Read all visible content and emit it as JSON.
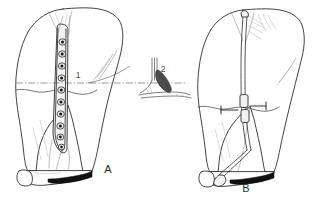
{
  "figure": {
    "background_color": "#ffffff",
    "ink_color": "#1f1f1f",
    "width": 319,
    "height": 203
  },
  "panels": [
    {
      "id": "A",
      "caption": "A",
      "caption_x": 108,
      "caption_y": 170,
      "description": "Leg with plate osteosynthesis, plate fixed with screws along the bone shaft",
      "implant": "bone-plate-with-screws",
      "screw_count": 10,
      "fracture_level_y": 89
    },
    {
      "id": "B",
      "caption": "B",
      "caption_x": 246,
      "caption_y": 189,
      "description": "Leg with intramedullary nail and transverse locking screws at the fracture level",
      "implant": "intramedullary-nail",
      "locking_screw_count": 2,
      "fracture_level_y": 106
    }
  ],
  "callouts": [
    {
      "number": "1",
      "x": 78,
      "y": 76,
      "target": "plate-level-reference-line"
    },
    {
      "number": "2",
      "x": 163,
      "y": 70,
      "target": "cross-section-inset"
    }
  ],
  "inset": {
    "id": "cross-section",
    "description": "Small cross-sectional detail view of the plate seated on the bone",
    "x": 150,
    "y": 60,
    "width": 46,
    "height": 42
  },
  "reference_line": {
    "style": "dash-dot",
    "from_x": 16,
    "to_x": 186,
    "y": 83
  }
}
